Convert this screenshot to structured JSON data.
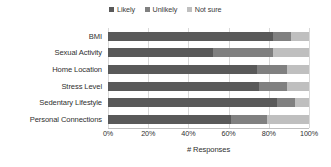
{
  "chart_data": {
    "type": "bar",
    "orientation": "horizontal",
    "stacked": true,
    "normalized_percent": true,
    "title": "",
    "xlabel": "# Responses",
    "ylabel": "",
    "xlim": [
      0,
      100
    ],
    "grid": true,
    "legend_position": "top-center",
    "xticklabels": [
      "0%",
      "20%",
      "40%",
      "60%",
      "80%",
      "100%"
    ],
    "xticks": [
      0,
      20,
      40,
      60,
      80,
      100
    ],
    "categories": [
      "BMI",
      "Sexual Activity",
      "Home Location",
      "Stress Level",
      "Sedentary Lifestyle",
      "Personal Connections"
    ],
    "series": [
      {
        "name": "Likely",
        "color": "#595959",
        "values": [
          82,
          52,
          74,
          75,
          84,
          61
        ]
      },
      {
        "name": "Unlikely",
        "color": "#808080",
        "values": [
          9,
          30,
          15,
          14,
          9,
          18
        ]
      },
      {
        "name": "Not sure",
        "color": "#bfbfbf",
        "values": [
          9,
          18,
          11,
          11,
          7,
          21
        ]
      }
    ]
  },
  "legend": {
    "entries": [
      {
        "label": "Likely",
        "color": "#595959"
      },
      {
        "label": "Unlikely",
        "color": "#808080"
      },
      {
        "label": "Not sure",
        "color": "#bfbfbf"
      }
    ]
  },
  "axis": {
    "x_title": "# Responses"
  }
}
